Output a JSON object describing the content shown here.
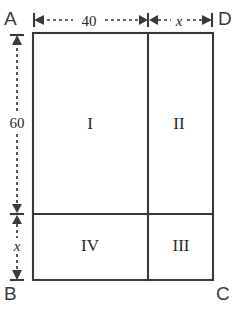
{
  "figure": {
    "type": "geometry-diagram",
    "shape": "rectangle-divided-into-four-regions",
    "background_color": "#ffffff",
    "line_color": "#3a3a3a",
    "corners": {
      "top_left": "A",
      "top_right": "D",
      "bottom_left": "B",
      "bottom_right": "C"
    },
    "regions": [
      {
        "id": "region-1",
        "label": "I",
        "position": "top-left"
      },
      {
        "id": "region-2",
        "label": "II",
        "position": "top-right"
      },
      {
        "id": "region-3",
        "label": "III",
        "position": "bottom-right"
      },
      {
        "id": "region-4",
        "label": "IV",
        "position": "bottom-left"
      }
    ],
    "dimensions": {
      "top_left_segment": "40",
      "top_right_segment": "x",
      "left_upper_segment": "60",
      "left_lower_segment": "x"
    }
  },
  "geometry": {
    "rect": {
      "left": 33,
      "top": 33,
      "right": 213,
      "bottom": 280
    },
    "vertical_divider_x": 148,
    "horizontal_divider_y": 214,
    "top_dim_y": 20,
    "left_dim_x": 17
  }
}
